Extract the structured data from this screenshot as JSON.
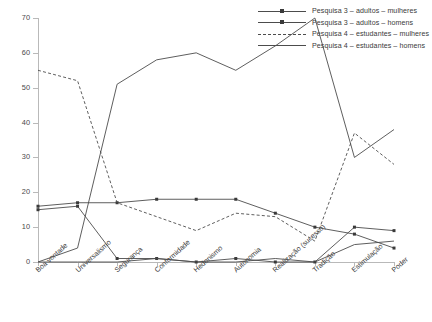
{
  "chart_data": {
    "type": "line",
    "title": "",
    "xlabel": "",
    "ylabel": "",
    "ylim": [
      0,
      70
    ],
    "ytick_step": 10,
    "grid": false,
    "legend_position": "top-right",
    "categories": [
      "Boa vontade",
      "Universalismo",
      "Segurança",
      "Conformidade",
      "Hedonismo",
      "Autonomia",
      "Realização (sucesso)",
      "Tradição",
      "Estimulação",
      "Poder"
    ],
    "ytick_labels": [
      "0",
      "10",
      "20",
      "30",
      "40",
      "50",
      "60",
      "70"
    ],
    "series": [
      {
        "name": "Pesquisa 3 – adultos – mulheres",
        "style": "solid",
        "marker": "square",
        "values": [
          16,
          17,
          17,
          18,
          18,
          18,
          14,
          10,
          8,
          4
        ]
      },
      {
        "name": "Pesquisa 3 – adultos – homens",
        "style": "solid",
        "marker": "square",
        "values": [
          15,
          16,
          1,
          1,
          0,
          1,
          0,
          0,
          10,
          9
        ]
      },
      {
        "name": "Pesquisa 4 – estudantes – mulheres",
        "style": "dashed",
        "marker": "none",
        "values": [
          55,
          52,
          17,
          13,
          9,
          14,
          13,
          6,
          37,
          28
        ]
      },
      {
        "name": "Pesquisa 4 – estudantes – homens",
        "style": "solid",
        "marker": "none",
        "values": [
          0,
          0,
          0,
          1,
          0,
          0,
          1,
          0,
          5,
          6
        ]
      }
    ],
    "series_extra": [
      {
        "name": "Pesquisa 4 – estudantes – homens (principal)",
        "style": "solid",
        "marker": "none",
        "values": [
          0,
          4,
          51,
          58,
          60,
          55,
          62,
          70,
          30,
          38
        ]
      }
    ]
  },
  "legend": {
    "entries": [
      {
        "label": "Pesquisa 3 – adultos – mulheres"
      },
      {
        "label": "Pesquisa 3 – adultos – homens"
      },
      {
        "label": "Pesquisa 4 – estudantes – mulheres"
      },
      {
        "label": "Pesquisa 4 – estudantes – homens"
      }
    ]
  },
  "colors": {
    "line": "#4c4c4c",
    "axis": "#b9b9b9",
    "text": "#3a3a3a",
    "background": "#ffffff"
  }
}
